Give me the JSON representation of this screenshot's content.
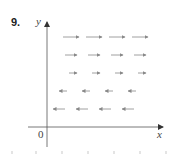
{
  "problem": {
    "number": "9."
  },
  "axes": {
    "x_label": "x",
    "y_label": "y",
    "origin_label": "0",
    "color": "#555555"
  },
  "vector_field": {
    "arrow_color": "#888888",
    "rows": [
      {
        "y": 37,
        "direction": "right",
        "length": 16,
        "xs": [
          71,
          94,
          117,
          140
        ]
      },
      {
        "y": 55,
        "direction": "right",
        "length": 12,
        "xs": [
          71,
          94,
          117,
          140
        ]
      },
      {
        "y": 73,
        "direction": "right",
        "length": 8,
        "xs": [
          73,
          96,
          119,
          142
        ]
      },
      {
        "y": 91,
        "direction": "left",
        "length": 8,
        "xs": [
          63,
          86,
          109,
          132
        ]
      },
      {
        "y": 109,
        "direction": "left",
        "length": 12,
        "xs": [
          59,
          82,
          105,
          128
        ]
      }
    ]
  },
  "bottom_ticks": [
    12,
    36,
    62,
    88,
    114,
    140,
    166
  ]
}
